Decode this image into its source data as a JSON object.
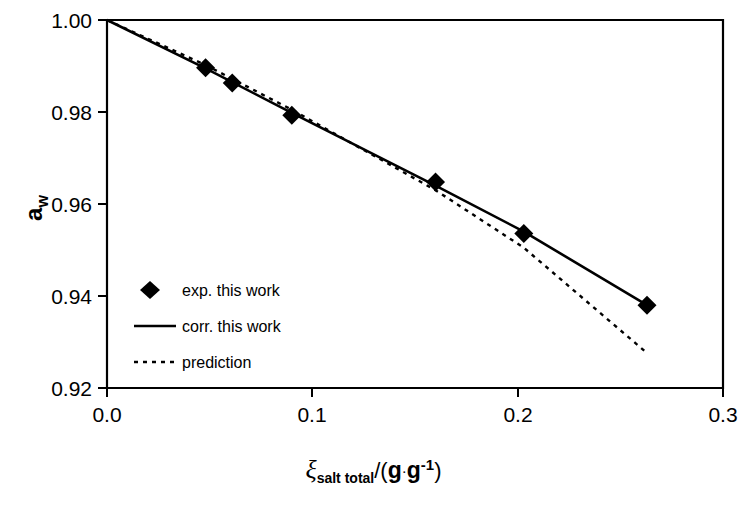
{
  "chart_data": {
    "type": "scatter",
    "title": "",
    "xlabel": "ξ_salt total /(g · g⁻¹)",
    "ylabel": "a_w",
    "xlim": [
      0.0,
      0.3
    ],
    "ylim": [
      0.92,
      1.0
    ],
    "xticks": [
      "0.0",
      "0.1",
      "0.2",
      "0.3"
    ],
    "xtick_values": [
      0.0,
      0.1,
      0.2,
      0.3
    ],
    "yticks": [
      "0.92",
      "0.94",
      "0.96",
      "0.98",
      "1.00"
    ],
    "ytick_values": [
      0.92,
      0.94,
      0.96,
      0.98,
      1.0
    ],
    "grid": false,
    "legend_position": "lower-left-inside",
    "series": [
      {
        "name": "exp. this work",
        "style": "marker",
        "marker": "diamond",
        "color": "#000000",
        "points": [
          {
            "x": 0.048,
            "y": 0.9896
          },
          {
            "x": 0.061,
            "y": 0.9863
          },
          {
            "x": 0.09,
            "y": 0.9793
          },
          {
            "x": 0.16,
            "y": 0.9648
          },
          {
            "x": 0.203,
            "y": 0.9536
          },
          {
            "x": 0.263,
            "y": 0.938
          }
        ]
      },
      {
        "name": "corr. this work",
        "style": "solid-line",
        "color": "#000000",
        "points": [
          {
            "x": 0.0,
            "y": 1.0
          },
          {
            "x": 0.048,
            "y": 0.9895
          },
          {
            "x": 0.09,
            "y": 0.9798
          },
          {
            "x": 0.16,
            "y": 0.964
          },
          {
            "x": 0.203,
            "y": 0.954
          },
          {
            "x": 0.263,
            "y": 0.938
          }
        ]
      },
      {
        "name": "prediction",
        "style": "dashed-line",
        "color": "#000000",
        "points": [
          {
            "x": 0.0,
            "y": 1.0
          },
          {
            "x": 0.048,
            "y": 0.9902
          },
          {
            "x": 0.09,
            "y": 0.9805
          },
          {
            "x": 0.13,
            "y": 0.9705
          },
          {
            "x": 0.16,
            "y": 0.963
          },
          {
            "x": 0.203,
            "y": 0.9505
          },
          {
            "x": 0.263,
            "y": 0.9276
          }
        ]
      }
    ]
  },
  "axes": {
    "y_label_main": "a",
    "y_label_sub": "w",
    "x_label_symbol": "ξ",
    "x_label_sub": "salt total",
    "x_label_slash": "/(",
    "x_label_unit_1": "g",
    "x_label_dot": "·",
    "x_label_unit_2": "g",
    "x_label_sup": "-1",
    "x_label_close": ")"
  },
  "legend": {
    "items": [
      {
        "label": "exp. this work",
        "kind": "diamond-marker"
      },
      {
        "label": "corr. this work",
        "kind": "solid-line"
      },
      {
        "label": "prediction",
        "kind": "dashed-line"
      }
    ]
  }
}
